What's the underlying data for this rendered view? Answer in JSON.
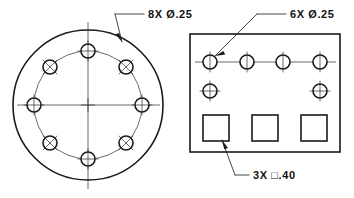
{
  "drawing": {
    "title": "Hole Pattern Detail Drawing",
    "sheet_background": "#ffffff",
    "line_color": "#1a1a1a",
    "center_line_color": "#3a3a3a"
  },
  "notes": {
    "hole_pattern_circular": "8X  Ø.25",
    "hole_pattern_rect": "6X  Ø.25",
    "square_pattern": "3X  □.40"
  },
  "views": {
    "circular_view": {
      "name": "circular-flange-view",
      "center": {
        "x": 88,
        "y": 105
      },
      "outer_diameter_px": 150,
      "bolt_circle_diameter_px": 108,
      "hole_diameter_px": 14,
      "hole_count": 8,
      "holes": [
        {
          "label": "hole-top",
          "angle_deg": 90,
          "crosshair": "plus"
        },
        {
          "label": "hole-upper-right",
          "angle_deg": 45,
          "crosshair": "cross"
        },
        {
          "label": "hole-right",
          "angle_deg": 0,
          "crosshair": "plus"
        },
        {
          "label": "hole-lower-right",
          "angle_deg": 315,
          "crosshair": "cross"
        },
        {
          "label": "hole-bottom",
          "angle_deg": 270,
          "crosshair": "plus"
        },
        {
          "label": "hole-lower-left",
          "angle_deg": 225,
          "crosshair": "cross"
        },
        {
          "label": "hole-left",
          "angle_deg": 180,
          "crosshair": "plus"
        },
        {
          "label": "hole-upper-left",
          "angle_deg": 135,
          "crosshair": "cross"
        }
      ]
    },
    "rect_view": {
      "name": "rectangular-plate-view",
      "bounds": {
        "x": 190,
        "y": 34,
        "width": 150,
        "height": 118
      },
      "hole_diameter_px": 14,
      "hole_count": 6,
      "holes_row_top": [
        {
          "label": "rect-hole-1",
          "cx": 210,
          "cy": 62
        },
        {
          "label": "rect-hole-2",
          "cx": 247,
          "cy": 62
        },
        {
          "label": "rect-hole-3",
          "cx": 283,
          "cy": 62
        },
        {
          "label": "rect-hole-4",
          "cx": 320,
          "cy": 62
        }
      ],
      "holes_row_bottom": [
        {
          "label": "rect-hole-5",
          "cx": 210,
          "cy": 91
        },
        {
          "label": "rect-hole-6",
          "cx": 320,
          "cy": 91
        }
      ],
      "square_count": 3,
      "square_size_px": 26,
      "squares": [
        {
          "label": "square-slot-1",
          "x": 203,
          "y": 115
        },
        {
          "label": "square-slot-2",
          "x": 252,
          "y": 115
        },
        {
          "label": "square-slot-3",
          "x": 301,
          "y": 115
        }
      ]
    }
  }
}
